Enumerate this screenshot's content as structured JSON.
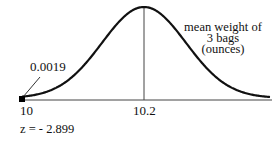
{
  "chart_data": {
    "type": "line",
    "title": "",
    "xlabel": "mean weight of 3 bags (ounces)",
    "ylabel": "",
    "distribution": "normal",
    "mean": 10.2,
    "x_ticks": [
      "10",
      "10.2"
    ],
    "shaded_tail": {
      "x_max": 10,
      "area": 0.0019,
      "label": "0.0019"
    },
    "z_annotation": "z = - 2.899",
    "grid": false,
    "legend": null,
    "colors": {
      "curve": "#111111",
      "axis": "#333333",
      "marker": "#000000"
    }
  },
  "labels": {
    "axis_title_line1": "mean weight of",
    "axis_title_line2": "3 bags",
    "axis_title_line3": "(ounces)",
    "tail_area": "0.0019",
    "tick_left": "10",
    "tick_mean": "10.2",
    "z_score": "z = - 2.899"
  }
}
